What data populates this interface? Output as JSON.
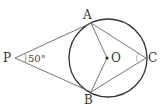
{
  "diagram": {
    "type": "geometry",
    "points": {
      "P": {
        "label": "P",
        "x": 15,
        "y": 58
      },
      "A": {
        "label": "A",
        "x": 91,
        "y": 23
      },
      "B": {
        "label": "B",
        "x": 91,
        "y": 92
      },
      "C": {
        "label": "C",
        "x": 146,
        "y": 58
      },
      "O": {
        "label": "O",
        "x": 107,
        "y": 58
      }
    },
    "circle": {
      "cx": 108,
      "cy": 58,
      "r": 39,
      "center_label": "O"
    },
    "segments": [
      "PA",
      "PB",
      "AO",
      "BO",
      "AC",
      "BC"
    ],
    "angle_label": "50°",
    "angle_vertex": "P",
    "colors": {
      "line": "#555555",
      "circle": "#333333",
      "background": "#ffffff"
    }
  }
}
